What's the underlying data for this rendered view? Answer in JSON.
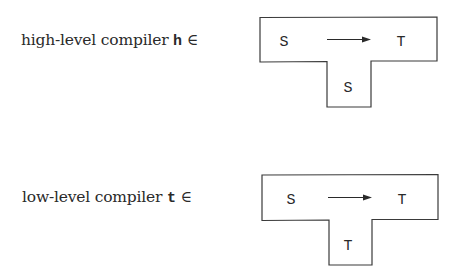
{
  "diagrams": [
    {
      "label_prefix": "high-level compiler",
      "variable": "h",
      "element_of": "∈",
      "source": "S",
      "arrow": "→",
      "target": "T",
      "implementation_language": "S"
    },
    {
      "label_prefix": "low-level compiler",
      "variable": "t",
      "element_of": "∈",
      "source": "S",
      "arrow": "→",
      "target": "T",
      "implementation_language": "T"
    }
  ],
  "colors": {
    "stroke": "#3a3a3a",
    "text": "#2a2a2a",
    "background": "#ffffff"
  }
}
